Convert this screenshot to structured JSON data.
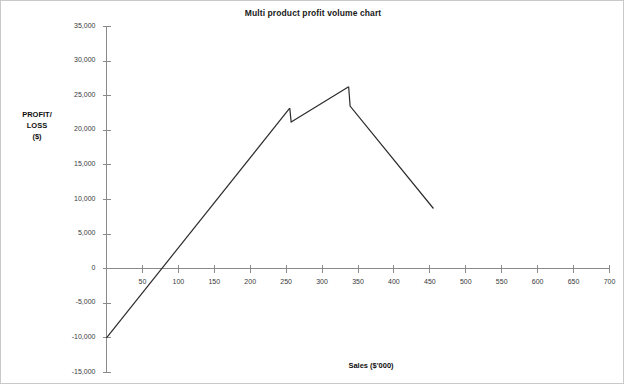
{
  "chart_data": {
    "type": "line",
    "title": "Multi product profit volume chart",
    "xlabel": "Sales ($'000)",
    "ylabel": "PROFIT/ LOSS ($)",
    "ylabel_lines": [
      "PROFIT/",
      "LOSS",
      "($)"
    ],
    "xlim": [
      0,
      700
    ],
    "ylim": [
      -15000,
      35000
    ],
    "grid": false,
    "legend": "none",
    "xticks": [
      50,
      100,
      150,
      200,
      250,
      300,
      350,
      400,
      450,
      500,
      550,
      600,
      650,
      700
    ],
    "xtick_labels": [
      "50",
      "100",
      "150",
      "200",
      "250",
      "300",
      "350",
      "400",
      "450",
      "500",
      "550",
      "600",
      "650",
      "700"
    ],
    "yticks": [
      35000,
      30000,
      25000,
      20000,
      15000,
      10000,
      5000,
      0,
      -5000,
      -10000,
      -15000
    ],
    "ytick_labels": [
      "35,000",
      "30,000",
      "25,000",
      "20,000",
      "15,000",
      "10,000",
      "5,000",
      "0",
      "-5,000",
      "-10,000",
      "-15,000"
    ],
    "line_color": "#2b2b2b",
    "axis_color": "#8a8a8a",
    "series": [
      {
        "name": "Cumulative profit",
        "segments": [
          {
            "name": "product-1",
            "x": [
              0,
              255
            ],
            "y": [
              -10000,
              23200
            ]
          },
          {
            "name": "product-2",
            "x": [
              255,
              257,
              337
            ],
            "y": [
              23200,
              21200,
              26300
            ]
          },
          {
            "name": "product-3",
            "x": [
              337,
              339,
              455
            ],
            "y": [
              26300,
              23500,
              8700
            ]
          }
        ]
      }
    ],
    "annotations": [
      {
        "name": "start-point",
        "x": 0,
        "y": -10000
      },
      {
        "name": "breakeven-point",
        "x": 80,
        "y": 0
      },
      {
        "name": "first-discontinuity",
        "x": 255,
        "y_from": 23200,
        "y_to": 21200
      },
      {
        "name": "peak-point",
        "x": 337,
        "y": 26300
      },
      {
        "name": "second-discontinuity",
        "x": 337,
        "y_from": 26300,
        "y_to": 23500
      },
      {
        "name": "end-point",
        "x": 455,
        "y": 8700
      }
    ]
  }
}
